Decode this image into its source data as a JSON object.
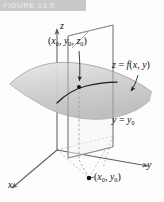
{
  "figure": {
    "banner_label": "FIGURE 13.9",
    "banner_color": "#c9c9c9"
  },
  "labels": {
    "point_3d": {
      "text": "(x0, y0, z0)",
      "base": "(x",
      "sub1": "0",
      "mid1": ", y",
      "sub2": "0",
      "mid2": ", z",
      "sub3": "0",
      "close": ")"
    },
    "surface": {
      "text": "z = f(x, y)",
      "lhs": "z",
      "eq": " = ",
      "fn": "f",
      "args": "(x, y)"
    },
    "plane": {
      "text": "y = y0",
      "lhs": "y",
      "eq": " = ",
      "rhs": "y",
      "sub": "0"
    },
    "point_2d": {
      "text": "(x0, y0)",
      "base": "(x",
      "sub1": "0",
      "mid1": ", y",
      "sub2": "0",
      "close": ")"
    },
    "axis_x": "x",
    "axis_y": "y",
    "axis_z": "z"
  },
  "geometry": {
    "origin": {
      "x": 57,
      "y": 150
    },
    "axis_z_tip": {
      "x": 57,
      "y": 26
    },
    "axis_x_tip": {
      "x": 8,
      "y": 192
    },
    "axis_y_tip": {
      "x": 152,
      "y": 168
    },
    "point_3d_marker": {
      "x": 79,
      "y": 87
    },
    "point_2d_marker": {
      "x": 89,
      "y": 178
    },
    "plane_corners": [
      {
        "x": 68,
        "y": 36
      },
      {
        "x": 113,
        "y": 25
      },
      {
        "x": 113,
        "y": 147
      },
      {
        "x": 68,
        "y": 158
      }
    ],
    "base_rect_corners": [
      {
        "x": 57,
        "y": 150
      },
      {
        "x": 113,
        "y": 136
      },
      {
        "x": 103,
        "y": 168
      },
      {
        "x": 44,
        "y": 182
      }
    ]
  },
  "colors": {
    "surface_fill": "#d4d4d4",
    "surface_edge": "#9a9a9a",
    "plane_edge": "#8e8e8e",
    "axis": "#6f6f6f",
    "curve": "#1d1d1d",
    "dashed": "#9e9e9e",
    "text": "#111111"
  }
}
